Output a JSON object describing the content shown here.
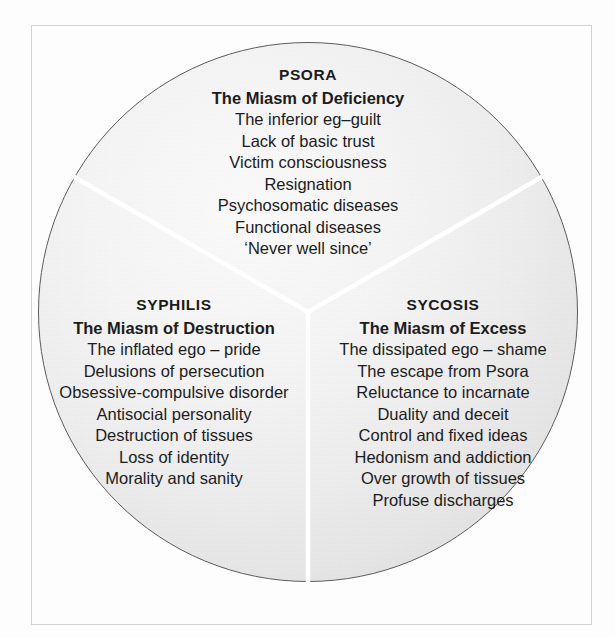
{
  "diagram": {
    "shape": "circle-three-sectors",
    "circle_border_color": "#5d5d5d",
    "divider_color": "#ffffff",
    "sectors": [
      {
        "id": "psora",
        "position": "top",
        "heading": "PSORA",
        "subheading": "The Miasm of Deficiency",
        "traits": [
          "The inferior eg–guilt",
          "Lack of basic trust",
          "Victim consciousness",
          "Resignation",
          "Psychosomatic diseases",
          "Functional diseases",
          "‘Never well since’"
        ]
      },
      {
        "id": "syphilis",
        "position": "bottom-left",
        "heading": "SYPHILIS",
        "subheading": "The Miasm of Destruction",
        "traits": [
          "The inflated ego – pride",
          "Delusions of persecution",
          "Obsessive-compulsive disorder",
          "Antisocial personality",
          "Destruction of tissues",
          "Loss of identity",
          "Morality and sanity"
        ]
      },
      {
        "id": "sycosis",
        "position": "bottom-right",
        "heading": "SYCOSIS",
        "subheading": "The Miasm of Excess",
        "traits": [
          "The dissipated ego – shame",
          "The escape from Psora",
          "Reluctance to incarnate",
          "Duality and deceit",
          "Control and fixed ideas",
          "Hedonism and addiction",
          "Over growth of tissues",
          "Profuse discharges"
        ]
      }
    ]
  }
}
